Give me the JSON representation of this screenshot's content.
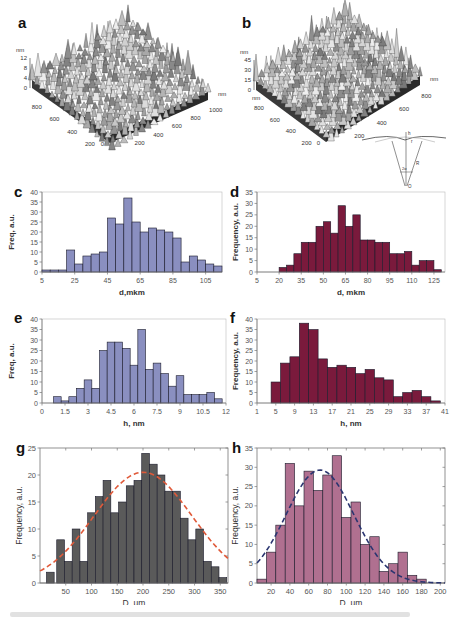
{
  "panels": {
    "a": {
      "label": "a",
      "z_unit": "nm",
      "z_ticks": [
        "12",
        "8",
        "4",
        "0"
      ],
      "y_ticks": [
        "800",
        "600",
        "400",
        "200"
      ],
      "x_ticks": [
        "0",
        "200",
        "400",
        "600",
        "800",
        "1000"
      ],
      "x_unit": "nm"
    },
    "b": {
      "label": "b",
      "z_unit": "nm",
      "z_ticks": [
        "45",
        "30",
        "15",
        "0"
      ],
      "y_unit": "nm",
      "y_ticks": [
        "800",
        "600",
        "400",
        "200"
      ],
      "x_ticks": [
        "0",
        "200",
        "400",
        "600",
        "800"
      ],
      "x_unit": "nm",
      "schematic": {
        "labels": [
          "h",
          "r",
          "R",
          "2α",
          "O"
        ]
      }
    },
    "c": {
      "label": "c"
    },
    "d": {
      "label": "d"
    },
    "e": {
      "label": "e"
    },
    "f": {
      "label": "f"
    },
    "g": {
      "label": "g"
    },
    "h": {
      "label": "h"
    }
  },
  "chart_data": [
    {
      "id": "c",
      "type": "bar",
      "title": "",
      "xlabel": "d,mkm",
      "ylabel": "Freq, a.u.",
      "x_ticks": [
        "5",
        "25",
        "45",
        "65",
        "85",
        "105"
      ],
      "y_ticks": [
        "0",
        "5",
        "10",
        "15",
        "20",
        "25",
        "30",
        "35",
        "40"
      ],
      "ylim": [
        0,
        40
      ],
      "bar_color": "#8a8fc0",
      "bin_centers": [
        7.5,
        12.5,
        17.5,
        22.5,
        27.5,
        32.5,
        37.5,
        42.5,
        47.5,
        52.5,
        57.5,
        62.5,
        67.5,
        72.5,
        77.5,
        82.5,
        87.5,
        92.5,
        97.5,
        102.5,
        107.5,
        112.5
      ],
      "values": [
        1,
        1,
        1,
        11,
        4,
        8,
        9,
        10,
        27,
        24,
        37,
        25,
        20,
        22,
        21,
        20,
        17,
        5,
        8,
        6,
        4,
        3
      ]
    },
    {
      "id": "d",
      "type": "bar",
      "title": "",
      "xlabel": "d, mkm",
      "ylabel": "Frequency, a.u.",
      "x_ticks": [
        "5",
        "20",
        "35",
        "50",
        "65",
        "80",
        "95",
        "110",
        "125"
      ],
      "y_ticks": [
        "0",
        "5",
        "10",
        "15",
        "20",
        "25",
        "30",
        "35"
      ],
      "ylim": [
        0,
        35
      ],
      "bar_color": "#7a1a3c",
      "bin_centers": [
        7.5,
        12.5,
        17.5,
        22.5,
        27.5,
        32.5,
        37.5,
        42.5,
        47.5,
        52.5,
        57.5,
        62.5,
        67.5,
        72.5,
        77.5,
        82.5,
        87.5,
        92.5,
        97.5,
        102.5,
        107.5,
        112.5,
        117.5,
        122.5,
        127.5
      ],
      "values": [
        0,
        0,
        0,
        2,
        3,
        8,
        13,
        13,
        20,
        22,
        17,
        29,
        20,
        25,
        14,
        14,
        13,
        13,
        8,
        8,
        9,
        3,
        5,
        5,
        1,
        2
      ]
    },
    {
      "id": "e",
      "type": "bar",
      "title": "",
      "xlabel": "h, nm",
      "ylabel": "Freq, a.u.",
      "x_ticks": [
        "0",
        "1.5",
        "3",
        "4.5",
        "6",
        "7.5",
        "9",
        "10.5",
        "12"
      ],
      "y_ticks": [
        "0",
        "5",
        "10",
        "15",
        "20",
        "25",
        "30",
        "35",
        "40"
      ],
      "ylim": [
        0,
        40
      ],
      "bar_color": "#8a8fc0",
      "bin_centers": [
        1.0,
        1.5,
        2.0,
        2.5,
        3.0,
        3.5,
        4.0,
        4.5,
        5.0,
        5.5,
        6.0,
        6.5,
        7.0,
        7.5,
        8.0,
        8.5,
        9.0,
        9.5,
        10.0,
        10.5,
        11.0,
        11.5
      ],
      "values": [
        3,
        1,
        3,
        7,
        11,
        7,
        25,
        29,
        29,
        26,
        18,
        35,
        16,
        19,
        14,
        8,
        13,
        4,
        4,
        4,
        5,
        2
      ]
    },
    {
      "id": "f",
      "type": "bar",
      "title": "",
      "xlabel": "h, nm",
      "ylabel": "Frequency, a.u.",
      "x_ticks": [
        "1",
        "5",
        "9",
        "13",
        "17",
        "21",
        "25",
        "29",
        "33",
        "37",
        "41"
      ],
      "y_ticks": [
        "0",
        "5",
        "10",
        "15",
        "20",
        "25",
        "30",
        "35",
        "40"
      ],
      "ylim": [
        0,
        40
      ],
      "bar_color": "#7a1a3c",
      "bin_centers": [
        5,
        7,
        9,
        11,
        13,
        15,
        17,
        19,
        21,
        23,
        25,
        27,
        29,
        31,
        33,
        35,
        37,
        39
      ],
      "values": [
        10,
        19,
        22,
        38,
        35,
        21,
        17,
        18,
        17,
        14,
        16,
        12,
        11,
        3,
        5,
        6,
        3,
        1
      ]
    },
    {
      "id": "g",
      "type": "bar",
      "title": "",
      "xlabel": "D, µm",
      "ylabel": "Frequency, a.u.",
      "x_ticks": [
        "50",
        "100",
        "150",
        "200",
        "250",
        "300",
        "350"
      ],
      "y_ticks": [
        "0",
        "5",
        "10",
        "15",
        "20",
        "25"
      ],
      "ylim": [
        0,
        25
      ],
      "xlim": [
        0,
        365
      ],
      "bar_color": "#5a5a5a",
      "bin_centers": [
        20,
        40,
        55,
        70,
        85,
        100,
        115,
        130,
        145,
        160,
        175,
        190,
        205,
        220,
        235,
        250,
        265,
        280,
        295,
        310,
        325,
        340,
        355
      ],
      "values": [
        2,
        8,
        4,
        10,
        4,
        13,
        16,
        19,
        13,
        15,
        18,
        19,
        24,
        22,
        20,
        17,
        17,
        12,
        8,
        10,
        4,
        3,
        1
      ],
      "fit": {
        "type": "gaussian",
        "color": "#e05a3a",
        "style": "dashed",
        "peak_x": 200,
        "peak_y": 20.5,
        "sigma": 95
      }
    },
    {
      "id": "h",
      "type": "bar",
      "title": "",
      "xlabel": "D, µm",
      "ylabel": "Frequency, a.u.",
      "x_ticks": [
        "20",
        "40",
        "60",
        "80",
        "100",
        "120",
        "140",
        "160",
        "180",
        "200"
      ],
      "y_ticks": [
        "0",
        "5",
        "10",
        "15",
        "20",
        "25",
        "30",
        "35"
      ],
      "ylim": [
        0,
        35
      ],
      "xlim": [
        5,
        205
      ],
      "bar_color": "#b07090",
      "bin_centers": [
        10,
        20,
        30,
        40,
        50,
        60,
        70,
        80,
        90,
        100,
        110,
        120,
        130,
        140,
        150,
        160,
        170,
        180
      ],
      "values": [
        1,
        8,
        15,
        31,
        20,
        29,
        24,
        28,
        33,
        17,
        21,
        10,
        12,
        3,
        5,
        8,
        2,
        1
      ],
      "fit": {
        "type": "gaussian",
        "color": "#2a3570",
        "style": "dashed",
        "peak_x": 72,
        "peak_y": 29.3,
        "sigma": 36
      }
    }
  ]
}
